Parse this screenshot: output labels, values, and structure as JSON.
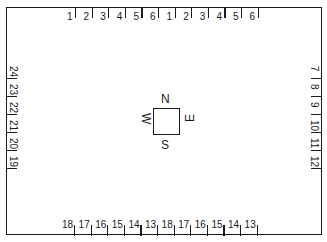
{
  "diagram": {
    "type": "floor-plan-seating-layout",
    "top_labels": [
      "1",
      "2",
      "3",
      "4",
      "5",
      "6",
      "1",
      "2",
      "3",
      "4",
      "5",
      "6"
    ],
    "right_labels": [
      "7",
      "8",
      "9",
      "10",
      "11",
      "12"
    ],
    "bottom_labels": [
      "18",
      "17",
      "16",
      "15",
      "14",
      "13",
      "18",
      "17",
      "16",
      "15",
      "14",
      "13"
    ],
    "left_labels": [
      "24",
      "23",
      "22",
      "21",
      "20",
      "19"
    ],
    "compass": {
      "north": "N",
      "east": "E",
      "south": "S",
      "west": "W"
    }
  }
}
